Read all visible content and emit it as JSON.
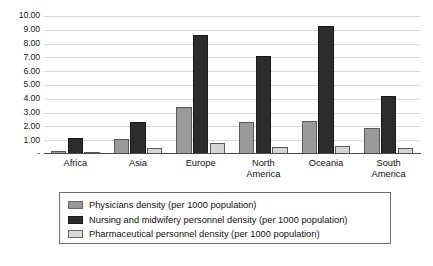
{
  "chart_data": {
    "type": "bar",
    "title": "",
    "xlabel": "",
    "ylabel": "",
    "ylim": [
      0,
      10
    ],
    "grid": true,
    "legend_position": "bottom",
    "categories": [
      "Africa",
      "Asia",
      "Europe",
      "North America",
      "Oceania",
      "South America"
    ],
    "ytick_labels": [
      "-",
      "1.00",
      "2.00",
      "3.00",
      "4.00",
      "5.00",
      "6.00",
      "7.00",
      "8.00",
      "9.00",
      "10.00"
    ],
    "ytick_values": [
      0,
      1,
      2,
      3,
      4,
      5,
      6,
      7,
      8,
      9,
      10
    ],
    "series": [
      {
        "name": "Physicians density (per 1000 population)",
        "color": "#9a9a9a",
        "values": [
          0.25,
          1.1,
          3.4,
          2.3,
          2.4,
          1.9
        ]
      },
      {
        "name": "Nursing and midwifery personnel density (per 1000 population)",
        "color": "#2b2b2b",
        "values": [
          1.15,
          2.3,
          8.6,
          7.1,
          9.3,
          4.2
        ]
      },
      {
        "name": "Pharmaceutical personnel density (per 1000 population)",
        "color": "#d5d5d5",
        "values": [
          0.08,
          0.45,
          0.78,
          0.5,
          0.6,
          0.4
        ]
      }
    ]
  }
}
